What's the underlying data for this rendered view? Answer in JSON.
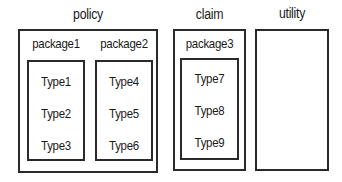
{
  "diagram": {
    "modules": [
      {
        "name": "policy",
        "packages": [
          {
            "name": "package1",
            "types": [
              "Type1",
              "Type2",
              "Type3"
            ]
          },
          {
            "name": "package2",
            "types": [
              "Type4",
              "Type5",
              "Type6"
            ]
          }
        ]
      },
      {
        "name": "claim",
        "packages": [
          {
            "name": "package3",
            "types": [
              "Type7",
              "Type8",
              "Type9"
            ]
          }
        ]
      },
      {
        "name": "utility",
        "packages": []
      }
    ]
  }
}
